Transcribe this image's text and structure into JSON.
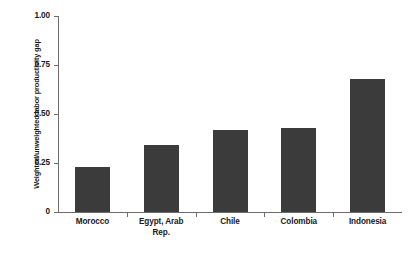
{
  "chart_data": {
    "type": "bar",
    "title": "",
    "xlabel": "",
    "ylabel": "Weighted/unweighted labor productivity gap",
    "categories": [
      "Morocco",
      "Egypt, Arab Rep.",
      "Chile",
      "Colombia",
      "Indonesia"
    ],
    "category_lines": [
      [
        "Morocco"
      ],
      [
        "Egypt, Arab",
        "Rep."
      ],
      [
        "Chile"
      ],
      [
        "Colombia"
      ],
      [
        "Indonesia"
      ]
    ],
    "values": [
      0.23,
      0.34,
      0.42,
      0.43,
      0.68
    ],
    "ylim": [
      0,
      1.0
    ],
    "yticks": [
      0,
      0.25,
      0.5,
      0.75,
      1.0
    ],
    "ytick_labels": [
      "0",
      "0.25",
      "0.50",
      "0.75",
      "1.00"
    ],
    "grid": false,
    "legend": null,
    "bar_color": "#3b3b3b",
    "axis_color": "#6d6d6d",
    "background_color": "#ffffff"
  }
}
